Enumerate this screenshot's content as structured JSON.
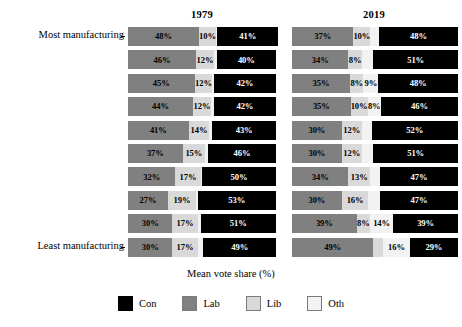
{
  "x_axis_title": "Mean vote share (%)",
  "y_axis": {
    "top_label": "Most manufacturing",
    "bottom_label": "Least manufacturing"
  },
  "facets": [
    {
      "title": "1979"
    },
    {
      "title": "2019"
    }
  ],
  "legend": {
    "items": [
      {
        "key": "con",
        "label": "Con",
        "color": "#000000"
      },
      {
        "key": "lab",
        "label": "Lab",
        "color": "#808080"
      },
      {
        "key": "lib",
        "label": "Lib",
        "color": "#d9d9d9"
      },
      {
        "key": "oth",
        "label": "Oth",
        "color": "#f2f2f2"
      }
    ]
  },
  "chart_data": {
    "type": "bar",
    "orientation": "horizontal",
    "stacked": true,
    "title": "",
    "xlabel": "Mean vote share (%)",
    "ylabel": "",
    "xlim": [
      0,
      100
    ],
    "grid": false,
    "legend_position": "bottom",
    "facet_variable": "year",
    "facets": [
      "1979",
      "2019"
    ],
    "categories": [
      "Most manufacturing",
      "decile 2",
      "decile 3",
      "decile 4",
      "decile 5",
      "decile 6",
      "decile 7",
      "decile 8",
      "decile 9",
      "Least manufacturing"
    ],
    "series_order": [
      "Lab",
      "Lib",
      "Oth",
      "Con"
    ],
    "series": [
      {
        "name": "Lab",
        "color": "#808080"
      },
      {
        "name": "Lib",
        "color": "#d9d9d9"
      },
      {
        "name": "Oth",
        "color": "#f2f2f2"
      },
      {
        "name": "Con",
        "color": "#000000"
      }
    ],
    "data": {
      "1979": {
        "Lab": [
          48,
          46,
          45,
          44,
          41,
          37,
          32,
          27,
          30,
          30
        ],
        "Lib": [
          10,
          12,
          12,
          12,
          14,
          15,
          17,
          19,
          17,
          17
        ],
        "Oth": [
          1,
          2,
          1,
          2,
          2,
          2,
          1,
          1,
          2,
          4
        ],
        "Con": [
          41,
          40,
          42,
          42,
          43,
          46,
          50,
          53,
          51,
          49
        ]
      },
      "2019": {
        "Lab": [
          37,
          34,
          35,
          35,
          30,
          30,
          34,
          30,
          39,
          49
        ],
        "Lib": [
          10,
          8,
          8,
          10,
          12,
          12,
          13,
          16,
          8,
          6
        ],
        "Oth": [
          5,
          7,
          9,
          8,
          6,
          7,
          6,
          7,
          14,
          16
        ],
        "Con": [
          48,
          51,
          48,
          46,
          52,
          51,
          47,
          47,
          39,
          29
        ]
      }
    }
  },
  "rows": [
    {
      "axis_label": "Most manufacturing",
      "facets": [
        {
          "segments": [
            {
              "party": "lab",
              "value": 48,
              "label": "48%"
            },
            {
              "party": "lib",
              "value": 10,
              "label": "10%"
            },
            {
              "party": "oth",
              "value": 1,
              "label": ""
            },
            {
              "party": "con",
              "value": 41,
              "label": "41%"
            }
          ]
        },
        {
          "segments": [
            {
              "party": "lab",
              "value": 37,
              "label": "37%"
            },
            {
              "party": "lib",
              "value": 10,
              "label": "10%"
            },
            {
              "party": "oth",
              "value": 5,
              "label": ""
            },
            {
              "party": "con",
              "value": 48,
              "label": "48%"
            }
          ]
        }
      ]
    },
    {
      "axis_label": "",
      "facets": [
        {
          "segments": [
            {
              "party": "lab",
              "value": 46,
              "label": "46%"
            },
            {
              "party": "lib",
              "value": 12,
              "label": "12%"
            },
            {
              "party": "oth",
              "value": 2,
              "label": ""
            },
            {
              "party": "con",
              "value": 40,
              "label": "40%"
            }
          ]
        },
        {
          "segments": [
            {
              "party": "lab",
              "value": 34,
              "label": "34%"
            },
            {
              "party": "lib",
              "value": 8,
              "label": "8%"
            },
            {
              "party": "oth",
              "value": 7,
              "label": ""
            },
            {
              "party": "con",
              "value": 51,
              "label": "51%"
            }
          ]
        }
      ]
    },
    {
      "axis_label": "",
      "facets": [
        {
          "segments": [
            {
              "party": "lab",
              "value": 45,
              "label": "45%"
            },
            {
              "party": "lib",
              "value": 12,
              "label": "12%"
            },
            {
              "party": "oth",
              "value": 1,
              "label": ""
            },
            {
              "party": "con",
              "value": 42,
              "label": "42%"
            }
          ]
        },
        {
          "segments": [
            {
              "party": "lab",
              "value": 35,
              "label": "35%"
            },
            {
              "party": "lib",
              "value": 8,
              "label": "8%"
            },
            {
              "party": "oth",
              "value": 9,
              "label": "9%"
            },
            {
              "party": "con",
              "value": 48,
              "label": "48%"
            }
          ]
        }
      ]
    },
    {
      "axis_label": "",
      "facets": [
        {
          "segments": [
            {
              "party": "lab",
              "value": 44,
              "label": "44%"
            },
            {
              "party": "lib",
              "value": 12,
              "label": "12%"
            },
            {
              "party": "oth",
              "value": 2,
              "label": ""
            },
            {
              "party": "con",
              "value": 42,
              "label": "42%"
            }
          ]
        },
        {
          "segments": [
            {
              "party": "lab",
              "value": 35,
              "label": "35%"
            },
            {
              "party": "lib",
              "value": 10,
              "label": "10%"
            },
            {
              "party": "oth",
              "value": 8,
              "label": "8%"
            },
            {
              "party": "con",
              "value": 46,
              "label": "46%"
            }
          ]
        }
      ]
    },
    {
      "axis_label": "",
      "facets": [
        {
          "segments": [
            {
              "party": "lab",
              "value": 41,
              "label": "41%"
            },
            {
              "party": "lib",
              "value": 14,
              "label": "14%"
            },
            {
              "party": "oth",
              "value": 2,
              "label": ""
            },
            {
              "party": "con",
              "value": 43,
              "label": "43%"
            }
          ]
        },
        {
          "segments": [
            {
              "party": "lab",
              "value": 30,
              "label": "30%"
            },
            {
              "party": "lib",
              "value": 12,
              "label": "12%"
            },
            {
              "party": "oth",
              "value": 6,
              "label": ""
            },
            {
              "party": "con",
              "value": 52,
              "label": "52%"
            }
          ]
        }
      ]
    },
    {
      "axis_label": "",
      "facets": [
        {
          "segments": [
            {
              "party": "lab",
              "value": 37,
              "label": "37%"
            },
            {
              "party": "lib",
              "value": 15,
              "label": "15%"
            },
            {
              "party": "oth",
              "value": 2,
              "label": ""
            },
            {
              "party": "con",
              "value": 46,
              "label": "46%"
            }
          ]
        },
        {
          "segments": [
            {
              "party": "lab",
              "value": 30,
              "label": "30%"
            },
            {
              "party": "lib",
              "value": 12,
              "label": "12%"
            },
            {
              "party": "oth",
              "value": 7,
              "label": ""
            },
            {
              "party": "con",
              "value": 51,
              "label": "51%"
            }
          ]
        }
      ]
    },
    {
      "axis_label": "",
      "facets": [
        {
          "segments": [
            {
              "party": "lab",
              "value": 32,
              "label": "32%"
            },
            {
              "party": "lib",
              "value": 17,
              "label": "17%"
            },
            {
              "party": "oth",
              "value": 1,
              "label": ""
            },
            {
              "party": "con",
              "value": 50,
              "label": "50%"
            }
          ]
        },
        {
          "segments": [
            {
              "party": "lab",
              "value": 34,
              "label": "34%"
            },
            {
              "party": "lib",
              "value": 13,
              "label": "13%"
            },
            {
              "party": "oth",
              "value": 6,
              "label": ""
            },
            {
              "party": "con",
              "value": 47,
              "label": "47%"
            }
          ]
        }
      ]
    },
    {
      "axis_label": "",
      "facets": [
        {
          "segments": [
            {
              "party": "lab",
              "value": 27,
              "label": "27%"
            },
            {
              "party": "lib",
              "value": 19,
              "label": "19%"
            },
            {
              "party": "oth",
              "value": 1,
              "label": ""
            },
            {
              "party": "con",
              "value": 53,
              "label": "53%"
            }
          ]
        },
        {
          "segments": [
            {
              "party": "lab",
              "value": 30,
              "label": "30%"
            },
            {
              "party": "lib",
              "value": 16,
              "label": "16%"
            },
            {
              "party": "oth",
              "value": 7,
              "label": ""
            },
            {
              "party": "con",
              "value": 47,
              "label": "47%"
            }
          ]
        }
      ]
    },
    {
      "axis_label": "",
      "facets": [
        {
          "segments": [
            {
              "party": "lab",
              "value": 30,
              "label": "30%"
            },
            {
              "party": "lib",
              "value": 17,
              "label": "17%"
            },
            {
              "party": "oth",
              "value": 2,
              "label": ""
            },
            {
              "party": "con",
              "value": 51,
              "label": "51%"
            }
          ]
        },
        {
          "segments": [
            {
              "party": "lab",
              "value": 39,
              "label": "39%"
            },
            {
              "party": "lib",
              "value": 8,
              "label": "8%"
            },
            {
              "party": "oth",
              "value": 14,
              "label": "14%"
            },
            {
              "party": "con",
              "value": 39,
              "label": "39%"
            }
          ]
        }
      ]
    },
    {
      "axis_label": "Least manufacturing",
      "facets": [
        {
          "segments": [
            {
              "party": "lab",
              "value": 30,
              "label": "30%"
            },
            {
              "party": "lib",
              "value": 17,
              "label": "17%"
            },
            {
              "party": "oth",
              "value": 4,
              "label": ""
            },
            {
              "party": "con",
              "value": 49,
              "label": "49%"
            }
          ]
        },
        {
          "segments": [
            {
              "party": "lab",
              "value": 49,
              "label": "49%"
            },
            {
              "party": "lib",
              "value": 6,
              "label": ""
            },
            {
              "party": "oth",
              "value": 16,
              "label": "16%"
            },
            {
              "party": "con",
              "value": 29,
              "label": "29%"
            }
          ]
        }
      ]
    }
  ]
}
